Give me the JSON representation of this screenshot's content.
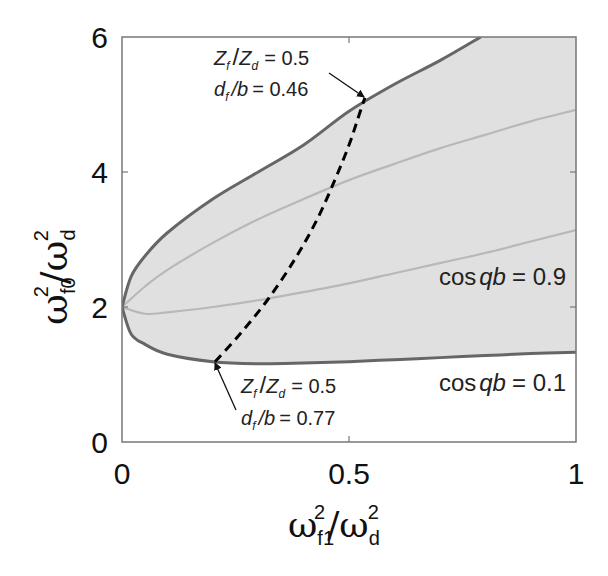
{
  "chart_data": {
    "type": "line",
    "title": "",
    "xlabel": "ω_f1^2 / ω_d^2",
    "ylabel": "ω_f0^2 / ω_d^2",
    "xlim": [
      0,
      1
    ],
    "ylim": [
      0,
      6
    ],
    "xticks": [
      0,
      0.5,
      1
    ],
    "xtick_labels": [
      "0",
      "0.5",
      "1"
    ],
    "yticks": [
      0,
      2,
      4,
      6
    ],
    "ytick_labels": [
      "0",
      "2",
      "4",
      "6"
    ],
    "grid": false,
    "legend": null,
    "shaded_region": {
      "description": "Pass band between cos qb = 0.1 (outer boundary) curves",
      "fill_color": "#e0e0e0"
    },
    "series": [
      {
        "name": "cos qb = 0.1 (upper branch)",
        "color": "#666666",
        "x": [
          0,
          0.02,
          0.05,
          0.1,
          0.2,
          0.3,
          0.4,
          0.5,
          0.6,
          0.7,
          0.79
        ],
        "y": [
          2.0,
          2.45,
          2.75,
          3.1,
          3.6,
          4.0,
          4.4,
          4.9,
          5.3,
          5.65,
          6.0
        ]
      },
      {
        "name": "cos qb = 0.1 (lower branch)",
        "color": "#666666",
        "x": [
          0,
          0.02,
          0.05,
          0.1,
          0.2,
          0.3,
          0.4,
          0.5,
          0.6,
          0.7,
          0.8,
          0.9,
          1.0
        ],
        "y": [
          2.0,
          1.6,
          1.45,
          1.3,
          1.19,
          1.16,
          1.17,
          1.19,
          1.22,
          1.25,
          1.28,
          1.31,
          1.33
        ]
      },
      {
        "name": "cos qb = 0.9 (upper branch)",
        "color": "#bbbbbb",
        "x": [
          0,
          0.05,
          0.1,
          0.2,
          0.3,
          0.4,
          0.5,
          0.6,
          0.7,
          0.8,
          0.9,
          1.0
        ],
        "y": [
          2.0,
          2.3,
          2.55,
          2.95,
          3.3,
          3.6,
          3.88,
          4.12,
          4.35,
          4.55,
          4.75,
          4.92
        ]
      },
      {
        "name": "cos qb = 0.9 (lower branch)",
        "color": "#bbbbbb",
        "x": [
          0,
          0.05,
          0.1,
          0.2,
          0.3,
          0.4,
          0.5,
          0.6,
          0.7,
          0.8,
          0.9,
          1.0
        ],
        "y": [
          2.0,
          1.9,
          1.92,
          2.0,
          2.1,
          2.22,
          2.35,
          2.5,
          2.65,
          2.8,
          2.97,
          3.14
        ]
      },
      {
        "name": "Z_f/Z_d = 0.5 path (dashed)",
        "color": "#000000",
        "style": "dashed",
        "x": [
          0.205,
          0.26,
          0.32,
          0.38,
          0.43,
          0.47,
          0.5,
          0.52,
          0.535
        ],
        "y": [
          1.19,
          1.6,
          2.1,
          2.7,
          3.3,
          3.9,
          4.4,
          4.8,
          5.1
        ]
      }
    ],
    "annotations": [
      {
        "text_line1": "Z_f / Z_d = 0.5",
        "text_line2": "d_f / b = 0.46",
        "points_to": [
          0.535,
          5.1
        ]
      },
      {
        "text_line1": "Z_f / Z_d = 0.5",
        "text_line2": "d_f / b = 0.77",
        "points_to": [
          0.205,
          1.19
        ]
      },
      {
        "text": "cos qb = 0.9",
        "at": [
          0.97,
          2.6
        ]
      },
      {
        "text": "cos qb = 0.1",
        "at": [
          0.97,
          0.95
        ]
      }
    ]
  },
  "labels": {
    "x_ticks": [
      "0",
      "0.5",
      "1"
    ],
    "y_ticks": [
      "0",
      "2",
      "4",
      "6"
    ],
    "x_axis": {
      "main": "ω",
      "sub": "f1",
      "sup": "2",
      "slash": "/",
      "main2": "ω",
      "sub2": "d",
      "sup2": "2"
    },
    "y_axis": {
      "main": "ω",
      "sub": "f0",
      "sup": "2",
      "slash": "/",
      "main2": "ω",
      "sub2": "d",
      "sup2": "2"
    },
    "annot_top": {
      "z": "Z",
      "zf": "f",
      "slash": "/",
      "zd_main": "Z",
      "zd": "d",
      "eq": "= 0.5",
      "d": "d",
      "df": "f",
      "b": "/b",
      "eq2": "= 0.46"
    },
    "annot_bottom": {
      "z": "Z",
      "zf": "f",
      "slash": "/",
      "zd_main": "Z",
      "zd": "d",
      "eq": "= 0.5",
      "d": "d",
      "df": "f",
      "b": "/b",
      "eq2": "= 0.77"
    },
    "cos09": {
      "cos": "cos",
      "qb": "qb",
      "eq": "= 0.9"
    },
    "cos01": {
      "cos": "cos",
      "qb": "qb",
      "eq": "=  0.1"
    }
  },
  "colors": {
    "fill": "#e0e0e0",
    "outer_curve": "#666666",
    "inner_curve": "#b8b8b8",
    "dashed": "#000000",
    "axes": "#777777"
  }
}
